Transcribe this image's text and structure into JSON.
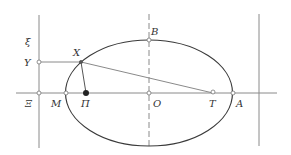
{
  "diagram": {
    "type": "geometry-ellipse-construction",
    "colors": {
      "line": "#8a8a8a",
      "curve": "#3a3a3a",
      "text": "#333333",
      "point_fill": "#ffffff",
      "point_solid": "#222222"
    },
    "labels": {
      "xi": "ξ",
      "Y": "Υ",
      "X": "Χ",
      "B": "Β",
      "Xi": "Ξ",
      "M": "Μ",
      "Pi": "Π",
      "O": "Ο",
      "T": "Τ",
      "A": "Α"
    },
    "points": {
      "Y": [
        39,
        62
      ],
      "X": [
        81,
        62
      ],
      "B": [
        149,
        40
      ],
      "Xi": [
        39,
        93
      ],
      "M": [
        66,
        93
      ],
      "Pi": [
        86,
        93
      ],
      "O": [
        149,
        93
      ],
      "T": [
        213,
        93
      ],
      "A": [
        233,
        93
      ]
    },
    "ellipse": {
      "cx": 149,
      "cy": 93,
      "rx": 83.5,
      "ry": 53
    }
  }
}
